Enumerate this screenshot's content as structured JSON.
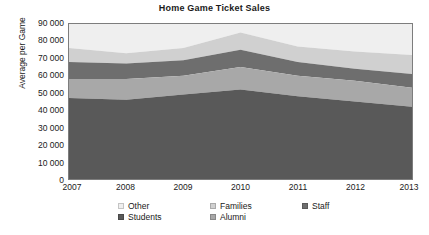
{
  "chart_data": {
    "type": "area",
    "title": "Home Game Ticket Sales",
    "subtitle": "",
    "xlabel": "",
    "ylabel": "Average per Game",
    "stacked": true,
    "grid": false,
    "legend_position": "bottom",
    "x": [
      2007,
      2008,
      2009,
      2010,
      2011,
      2012,
      2013
    ],
    "categories": [
      "2007",
      "2008",
      "2009",
      "2010",
      "2011",
      "2012",
      "2013"
    ],
    "xlim": [
      2007,
      2013
    ],
    "ylim": [
      0,
      90000
    ],
    "ytick_labels": [
      "0",
      "10 000",
      "20 000",
      "30 000",
      "40 000",
      "50 000",
      "60 000",
      "70 000",
      "80 000",
      "90 000"
    ],
    "ytick_values": [
      0,
      10000,
      20000,
      30000,
      40000,
      50000,
      60000,
      70000,
      80000,
      90000
    ],
    "xtick_labels": [
      "2007",
      "2008",
      "2009",
      "2010",
      "2011",
      "2012",
      "2013"
    ],
    "series": [
      {
        "name": "Students",
        "color": "#595959",
        "values": [
          47000,
          46000,
          49000,
          52000,
          48000,
          45000,
          42000
        ],
        "cumulative_top": [
          47000,
          46000,
          49000,
          52000,
          48000,
          45000,
          42000
        ]
      },
      {
        "name": "Alumni",
        "color": "#a8a8a8",
        "values": [
          11000,
          12000,
          11000,
          13000,
          12000,
          12000,
          11000
        ],
        "cumulative_top": [
          58000,
          58000,
          60000,
          65000,
          60000,
          57000,
          53000
        ]
      },
      {
        "name": "Families",
        "color": "#6e6e6e",
        "values": [
          10000,
          9000,
          9000,
          10000,
          8000,
          7000,
          8000
        ],
        "cumulative_top": [
          68000,
          67000,
          69000,
          75000,
          68000,
          64000,
          61000
        ]
      },
      {
        "name": "Staff",
        "color": "#d0d0d0",
        "values": [
          8000,
          6000,
          7000,
          10000,
          9000,
          10000,
          11000
        ],
        "cumulative_top": [
          76000,
          73000,
          76000,
          85000,
          77000,
          74000,
          72000
        ]
      },
      {
        "name": "Other",
        "color": "#efefef",
        "values": [
          14000,
          17000,
          14000,
          5000,
          13000,
          16000,
          18000
        ],
        "cumulative_top": [
          90000,
          90000,
          90000,
          90000,
          90000,
          90000,
          90000
        ]
      }
    ],
    "legend": [
      {
        "label": "Other",
        "color": "#efefef"
      },
      {
        "label": "Families",
        "color": "#d0d0d0"
      },
      {
        "label": "Staff",
        "color": "#6e6e6e"
      },
      {
        "label": "Students",
        "color": "#595959"
      },
      {
        "label": "Alumni",
        "color": "#a8a8a8"
      }
    ]
  },
  "colors": {
    "axis": "#7d7d7d",
    "text": "#1a1a1a",
    "background": "#ffffff"
  }
}
